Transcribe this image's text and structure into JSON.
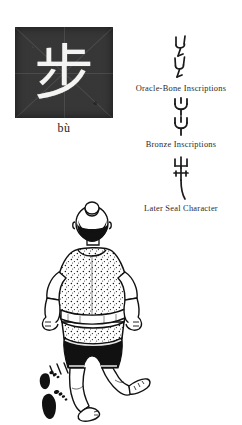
{
  "page": {
    "background_color": "#ffffff",
    "ink_color": "#1a1a1a"
  },
  "character_card": {
    "character": "步",
    "pinyin": "bù",
    "box_background_color": "#2b2b2b",
    "character_color": "#f4f4f2"
  },
  "script_stages": [
    {
      "id": "oracle-bone",
      "label": "Oracle-Bone Inscriptions",
      "glyph_name": "two-stacked-footprint-glyph"
    },
    {
      "id": "bronze",
      "label": "Bronze Inscriptions",
      "glyph_name": "two-stacked-rounded-footprint-glyph"
    },
    {
      "id": "later-seal",
      "label": "Later Seal Character",
      "glyph_name": "vertical-seal-stride-glyph"
    }
  ],
  "illustration": {
    "name": "walking-person-from-behind-with-footprints",
    "subject": "person walking away, seen from behind",
    "details": {
      "cap": "dark hair bun / cap",
      "shirt": "speckled light tunic with sash",
      "shorts": "black shorts",
      "feet": "bare feet",
      "trail": "two black footprints",
      "motion_marks": "three short speed lines"
    },
    "colors": {
      "ink": "#111111",
      "paper": "#ffffff"
    }
  }
}
